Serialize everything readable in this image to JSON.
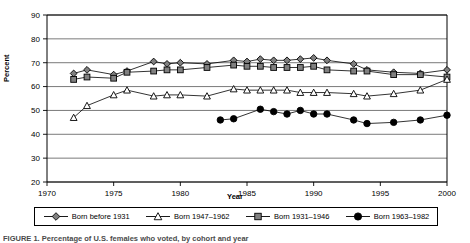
{
  "figure": {
    "caption": "FIGURE 1. Percentage of U.S. females who voted, by cohort and year"
  },
  "axes": {
    "ylabel": "Percent",
    "xlabel": "Year",
    "yticks": [
      20,
      30,
      40,
      50,
      60,
      70,
      80,
      90
    ],
    "xticks": [
      1970,
      1975,
      1980,
      1985,
      1990,
      1995,
      2000
    ]
  },
  "legend": {
    "items": [
      {
        "label": "Born before 1931",
        "marker": "diamond",
        "fill": "#808080"
      },
      {
        "label": "Born 1947–1962",
        "marker": "triangle",
        "fill": "#ffffff"
      },
      {
        "label": "Born 1931–1946",
        "marker": "square",
        "fill": "#808080"
      },
      {
        "label": "Born 1963–1982",
        "marker": "circle",
        "fill": "#000000"
      }
    ]
  },
  "chart_data": {
    "type": "line",
    "title": "",
    "xlabel": "Year",
    "ylabel": "Percent",
    "xlim": [
      1970,
      2000
    ],
    "ylim": [
      20,
      90
    ],
    "grid": true,
    "legend_position": "bottom",
    "series": [
      {
        "name": "Born before 1931",
        "marker": "diamond",
        "x": [
          1972,
          1973,
          1975,
          1976,
          1978,
          1979,
          1980,
          1982,
          1984,
          1985,
          1986,
          1987,
          1988,
          1989,
          1990,
          1991,
          1993,
          1994,
          1996,
          1998,
          2000
        ],
        "values": [
          65.5,
          67,
          65,
          66.5,
          70.5,
          69.5,
          70,
          69.5,
          71,
          70.5,
          71.5,
          71,
          71,
          71.5,
          72,
          71,
          69.5,
          67,
          66,
          65.5,
          67
        ]
      },
      {
        "name": "Born 1931–1946",
        "marker": "square",
        "x": [
          1972,
          1973,
          1975,
          1976,
          1978,
          1979,
          1980,
          1982,
          1984,
          1985,
          1986,
          1987,
          1988,
          1989,
          1990,
          1991,
          1993,
          1994,
          1996,
          1998,
          2000
        ],
        "values": [
          63,
          64,
          63.5,
          66,
          66.5,
          67,
          67,
          68,
          69,
          68.5,
          68.5,
          68,
          68,
          68,
          68.5,
          67,
          66.5,
          66.5,
          65,
          65,
          64
        ]
      },
      {
        "name": "Born 1947–1962",
        "marker": "triangle",
        "x": [
          1972,
          1973,
          1975,
          1976,
          1978,
          1979,
          1980,
          1982,
          1984,
          1985,
          1986,
          1987,
          1988,
          1989,
          1990,
          1991,
          1993,
          1994,
          1996,
          1998,
          2000
        ],
        "values": [
          47,
          52,
          56.5,
          58.5,
          56,
          56.5,
          56.5,
          56,
          59,
          58.5,
          58.5,
          58.5,
          58.5,
          57.5,
          57.5,
          57.5,
          57,
          56,
          57,
          58.5,
          63
        ]
      },
      {
        "name": "Born 1963–1982",
        "marker": "circle",
        "x": [
          1983,
          1984,
          1986,
          1987,
          1988,
          1989,
          1990,
          1991,
          1993,
          1994,
          1996,
          1998,
          2000
        ],
        "values": [
          46,
          46.5,
          50.5,
          49.5,
          48.5,
          50,
          48.5,
          48.5,
          46,
          44.5,
          45,
          46,
          48
        ]
      }
    ]
  }
}
